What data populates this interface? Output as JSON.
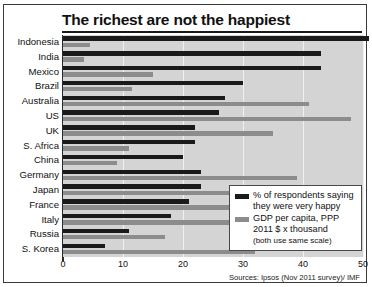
{
  "chart_data": {
    "type": "bar",
    "orientation": "horizontal",
    "title": "The richest are not the happiest",
    "xlabel": "",
    "ylabel": "",
    "xlim": [
      0,
      50
    ],
    "xticks": [
      0,
      10,
      20,
      30,
      40,
      50
    ],
    "grid": true,
    "legend_position": "bottom-right",
    "categories": [
      "Indonesia",
      "India",
      "Mexico",
      "Brazil",
      "Australia",
      "US",
      "UK",
      "S. Africa",
      "China",
      "Germany",
      "Japan",
      "France",
      "Italy",
      "Russia",
      "S. Korea"
    ],
    "series": [
      {
        "name": "% of respondents saying they were very happy",
        "color": "#1a1a1a",
        "values": [
          51,
          43,
          43,
          30,
          27,
          26,
          22,
          22,
          20,
          23,
          23,
          21,
          18,
          11,
          7
        ]
      },
      {
        "name": "GDP per capita, PPP 2011 $ x thousand",
        "color": "#8c8c8c",
        "values": [
          4.5,
          3.5,
          15,
          11.5,
          41,
          48,
          35,
          11,
          9,
          39,
          35,
          35,
          33,
          17,
          32
        ]
      }
    ],
    "legend_note": "(both use same scale)",
    "source": "Sources: Ipsos (Nov 2011 survey)/ IMF"
  }
}
